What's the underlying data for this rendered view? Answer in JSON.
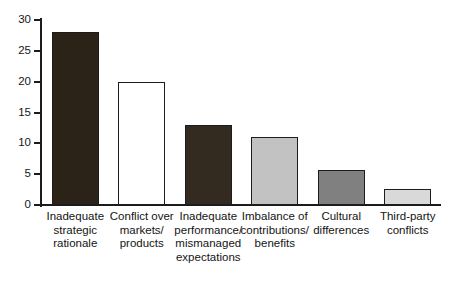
{
  "chart_data": {
    "type": "bar",
    "title": "",
    "subtitle": "",
    "xlabel": "",
    "ylabel": "",
    "ylim": [
      0,
      30
    ],
    "yticks": [
      0,
      5,
      10,
      15,
      20,
      25,
      30
    ],
    "ytick_labels": [
      "0",
      "5",
      "10",
      "15",
      "20",
      "25",
      "30"
    ],
    "grid": false,
    "legend": "none",
    "categories": [
      "Inadequate\nstrategic\nrationale",
      "Conflict over\nmarkets/\nproducts",
      "Inadequate\nperformance/\nmismanaged\nexpectations",
      "Imbalance of\ncontributions/\nbenefits",
      "Cultural\ndifferences",
      "Third-party\nconflicts"
    ],
    "values": [
      28,
      20,
      13,
      11,
      5.7,
      2.6
    ],
    "bar_colors": [
      "#2b2318",
      "#ffffff",
      "#332b20",
      "#c2c2c2",
      "#808080",
      "#d9d9d9"
    ],
    "bar_edge_color": "#1c1c1c",
    "axis_color": "#1c1c1c",
    "background": "#ffffff"
  },
  "axis": {
    "tick_labels": [
      "30",
      "25",
      "20",
      "15",
      "10",
      "5",
      "0"
    ]
  }
}
